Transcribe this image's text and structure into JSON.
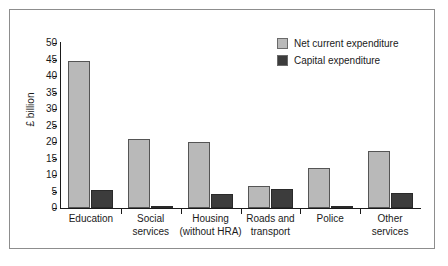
{
  "chart_data": {
    "type": "bar",
    "title": "",
    "xlabel": "",
    "ylabel": "£ billion",
    "ylim": [
      0,
      50
    ],
    "ytick_values": [
      50,
      45,
      40,
      35,
      30,
      25,
      20,
      15,
      10,
      5,
      0
    ],
    "ytick_labels": [
      "50",
      "45",
      "40",
      "35",
      "30",
      "25",
      "20",
      "15",
      "10",
      "5",
      "0"
    ],
    "grid": false,
    "legend_position": "top-right",
    "categories": [
      "Education",
      "Social services",
      "Housing (without HRA)",
      "Roads and transport",
      "Police",
      "Other services"
    ],
    "category_lines": [
      [
        "Education"
      ],
      [
        "Social",
        "services"
      ],
      [
        "Housing",
        "(without HRA)"
      ],
      [
        "Roads and",
        "transport"
      ],
      [
        "Police"
      ],
      [
        "Other",
        "services"
      ]
    ],
    "series": [
      {
        "name": "Net current expenditure",
        "color": "#b9b9b9",
        "values": [
          44.7,
          20.9,
          19.9,
          6.8,
          12.0,
          17.2
        ]
      },
      {
        "name": "Capital expenditure",
        "color": "#3c3c3c",
        "values": [
          5.4,
          0.3,
          4.3,
          5.9,
          0.6,
          4.7
        ]
      }
    ]
  },
  "legend": {
    "items": [
      {
        "label": "Net current expenditure",
        "color": "#b9b9b9"
      },
      {
        "label": "Capital expenditure",
        "color": "#3c3c3c"
      }
    ]
  },
  "axes": {
    "y_label": "£ billion"
  }
}
